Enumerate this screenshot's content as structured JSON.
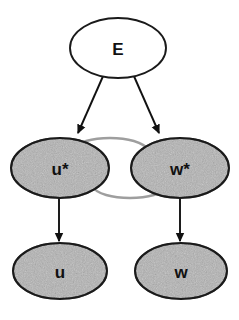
{
  "diagram": {
    "type": "directed-graph",
    "title": "",
    "background_color": "#ffffff",
    "colors": {
      "node_fill_shaded": "#b3b3b3",
      "node_fill_plain": "#ffffff",
      "node_stroke": "#1a1a1a",
      "black_edge": "#111111",
      "gray_edge": "#9e9e9e",
      "label_text": "#111111"
    },
    "nodes": [
      {
        "id": "E",
        "label": "E",
        "shape": "ellipse",
        "fill": "plain",
        "cx": 118,
        "cy": 48,
        "rx": 48,
        "ry": 30,
        "font_size": 17
      },
      {
        "id": "u_star",
        "label": "u*",
        "shape": "ellipse",
        "fill": "shaded",
        "cx": 60,
        "cy": 168,
        "rx": 49,
        "ry": 30,
        "font_size": 17
      },
      {
        "id": "w_star",
        "label": "w*",
        "shape": "ellipse",
        "fill": "shaded",
        "cx": 180,
        "cy": 168,
        "rx": 49,
        "ry": 30,
        "font_size": 17
      },
      {
        "id": "u",
        "label": "u",
        "shape": "ellipse",
        "fill": "shaded",
        "cx": 60,
        "cy": 271,
        "rx": 47,
        "ry": 28,
        "font_size": 17
      },
      {
        "id": "w",
        "label": "w",
        "shape": "ellipse",
        "fill": "shaded",
        "cx": 181,
        "cy": 271,
        "rx": 46,
        "ry": 28,
        "font_size": 17
      }
    ],
    "edges": [
      {
        "id": "edge-e-to-ustar",
        "from": "E",
        "to": "u_star",
        "style": "straight",
        "color": "black",
        "arrowhead": "filled-triangle"
      },
      {
        "id": "edge-e-to-wstar",
        "from": "E",
        "to": "w_star",
        "style": "straight",
        "color": "black",
        "arrowhead": "filled-triangle"
      },
      {
        "id": "edge-wstar-to-ustar",
        "from": "w_star",
        "to": "u_star",
        "style": "curved-upper",
        "color": "gray",
        "arrowhead": "filled-triangle"
      },
      {
        "id": "edge-ustar-to-wstar",
        "from": "u_star",
        "to": "w_star",
        "style": "curved-lower",
        "color": "gray",
        "arrowhead": "filled-triangle"
      },
      {
        "id": "edge-ustar-to-u",
        "from": "u_star",
        "to": "u",
        "style": "straight-vertical",
        "color": "black",
        "arrowhead": "filled-triangle"
      },
      {
        "id": "edge-wstar-to-w",
        "from": "w_star",
        "to": "w",
        "style": "straight-vertical",
        "color": "black",
        "arrowhead": "filled-triangle"
      }
    ]
  }
}
